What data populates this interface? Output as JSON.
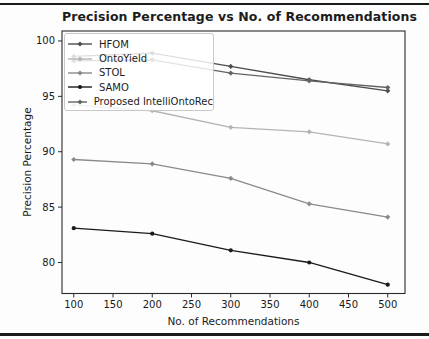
{
  "window": {
    "width": 429,
    "height": 339,
    "background": "#fdfdfd",
    "rule_color": "#1a1a1a"
  },
  "chart_data": {
    "type": "line",
    "title": "Precision Percentage vs No. of Recommendations",
    "xlabel": "No. of Recommendations",
    "ylabel": "Precision Percentage",
    "x": [
      100,
      200,
      300,
      400,
      500
    ],
    "x_ticks": [
      100,
      150,
      200,
      250,
      300,
      350,
      400,
      450,
      500
    ],
    "y_ticks": [
      80,
      85,
      90,
      95,
      100
    ],
    "xlim": [
      85,
      522
    ],
    "ylim": [
      77.2,
      100.9
    ],
    "grid": false,
    "legend_position": "upper-left",
    "axis_color": "#2b2b2b",
    "tick_label_color": "#1a1a1a",
    "series": [
      {
        "name": "HFOM",
        "color": "#4d4d4d",
        "marker": "diamond",
        "values": [
          98.6,
          98.9,
          97.7,
          96.5,
          95.5
        ]
      },
      {
        "name": "OntoYield",
        "color": "#b4b4b4",
        "marker": "diamond",
        "values": [
          94.2,
          93.7,
          92.2,
          91.8,
          90.7
        ]
      },
      {
        "name": "STOL",
        "color": "#8a8a8a",
        "marker": "diamond",
        "values": [
          89.3,
          88.9,
          87.6,
          85.3,
          84.1
        ]
      },
      {
        "name": "SAMO",
        "color": "#1a1a1a",
        "marker": "circle",
        "values": [
          83.1,
          82.6,
          81.1,
          80.0,
          78.0
        ]
      },
      {
        "name": "Proposed IntelliOntoRec",
        "color": "#636363",
        "marker": "diamond",
        "values": [
          98.2,
          98.3,
          97.1,
          96.4,
          95.8
        ]
      }
    ]
  }
}
